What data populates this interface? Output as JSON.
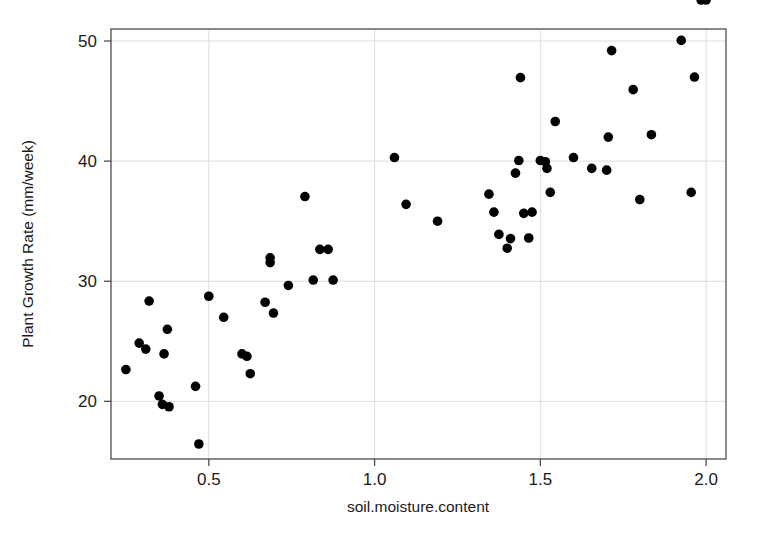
{
  "chart_data": {
    "type": "scatter",
    "title": "",
    "xlabel": "soil.moisture.content",
    "ylabel": "Plant Growth Rate (mm/week)",
    "xlim": [
      0.205,
      2.06
    ],
    "ylim": [
      15.2,
      51.0
    ],
    "xticks": [
      0.5,
      1.0,
      1.5,
      2.0
    ],
    "xtick_labels": [
      "0.5",
      "1.0",
      "1.5",
      "2.0"
    ],
    "yticks": [
      20,
      30,
      40,
      50
    ],
    "ytick_labels": [
      "20",
      "30",
      "40",
      "50"
    ],
    "grid": true,
    "grid_color": "#d9d9d9",
    "legend": null,
    "point_color": "#000000",
    "point_shape": "circle",
    "point_size": 9,
    "n_points": 56,
    "x": [
      0.25,
      0.29,
      0.31,
      0.32,
      0.35,
      0.36,
      0.365,
      0.375,
      0.38,
      0.46,
      0.47,
      0.5,
      0.545,
      0.6,
      0.615,
      0.625,
      0.67,
      0.685,
      0.685,
      0.695,
      0.74,
      0.79,
      0.815,
      0.835,
      0.86,
      0.875,
      1.06,
      1.095,
      1.19,
      1.345,
      1.36,
      1.375,
      1.4,
      1.41,
      1.425,
      1.435,
      1.44,
      1.45,
      1.465,
      1.475,
      1.5,
      1.515,
      1.52,
      1.53,
      1.545,
      1.6,
      1.655,
      1.7,
      1.705,
      1.715,
      1.78,
      1.8,
      1.835,
      1.925,
      1.955,
      1.965,
      1.985,
      2.0
    ],
    "y": [
      22.65,
      24.85,
      24.35,
      28.35,
      20.45,
      19.75,
      23.95,
      26.0,
      19.55,
      21.25,
      16.45,
      28.75,
      27.0,
      23.95,
      23.75,
      22.3,
      28.25,
      31.95,
      31.55,
      27.35,
      29.65,
      37.05,
      30.1,
      32.65,
      32.65,
      30.1,
      40.3,
      36.4,
      35.0,
      37.25,
      35.75,
      33.9,
      32.75,
      33.55,
      39.0,
      40.05,
      46.95,
      35.65,
      33.6,
      35.75,
      40.05,
      39.95,
      39.4,
      37.4,
      43.3,
      40.3,
      39.4,
      39.25,
      42.0,
      49.2,
      45.95,
      36.8,
      42.2,
      50.05,
      37.4,
      47.0
    ]
  },
  "figure": {
    "background": "#ffffff",
    "panel_background": "#ffffff",
    "border_color": "#4d4d4d"
  },
  "labels": {
    "x_axis_title": "soil.moisture.content",
    "y_axis_title": "Plant Growth Rate (mm/week)"
  }
}
